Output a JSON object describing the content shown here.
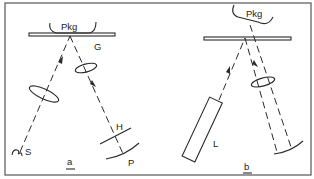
{
  "figure": {
    "panels": [
      {
        "id": "a",
        "caption": "a",
        "labels": {
          "package": "Pkg",
          "glass": "G",
          "source": "S",
          "hologram": "H",
          "plate": "P"
        }
      },
      {
        "id": "b",
        "caption": "b",
        "labels": {
          "package": "Pkg",
          "laser": "L"
        }
      }
    ],
    "colors": {
      "line": "#2a2a2a",
      "frame": "#555555",
      "background": "#ffffff"
    }
  }
}
